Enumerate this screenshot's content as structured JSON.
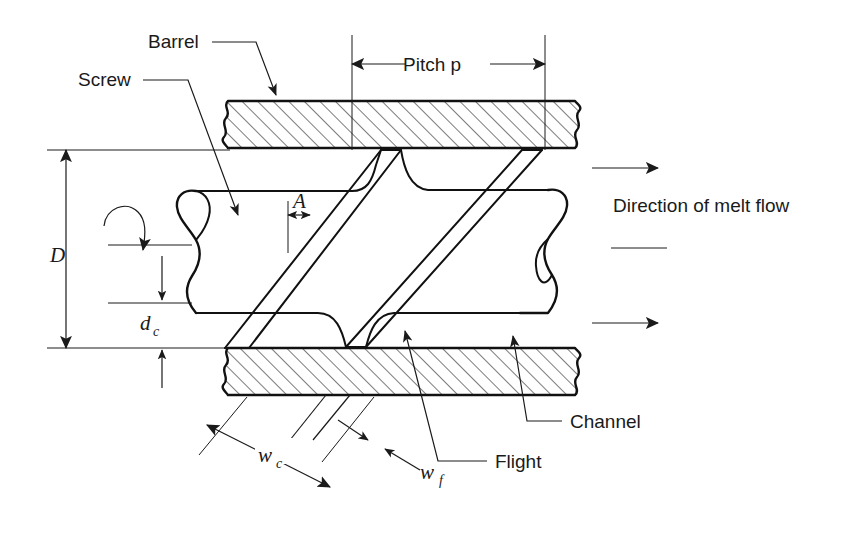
{
  "figure": {
    "background_color": "#ffffff",
    "line_color": "#1a1a1a",
    "labels": {
      "barrel": "Barrel",
      "screw": "Screw",
      "pitch": "Pitch p",
      "melt_flow": "Direction of melt flow",
      "channel": "Channel",
      "flight": "Flight",
      "diameter": "D",
      "channel_depth_main": "d",
      "channel_depth_sub": "c",
      "flight_land": "A",
      "channel_width_main": "w",
      "channel_width_sub": "c",
      "flight_width_main": "w",
      "flight_width_sub": "f"
    }
  }
}
